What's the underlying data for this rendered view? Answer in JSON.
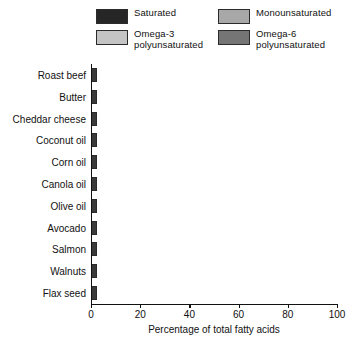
{
  "chart_data": {
    "type": "bar",
    "orientation": "horizontal",
    "stacked": true,
    "title": "",
    "xlabel": "Percentage of total fatty acids",
    "ylabel": "",
    "xlim": [
      0,
      100
    ],
    "xticks": [
      0,
      20,
      40,
      60,
      80,
      100
    ],
    "grid": false,
    "legend_position": "top",
    "categories": [
      "Roast beef",
      "Butter",
      "Cheddar cheese",
      "Coconut oil",
      "Corn oil",
      "Canola oil",
      "Olive oil",
      "Avocado",
      "Salmon",
      "Walnuts",
      "Flax seed"
    ],
    "series": [
      {
        "name": "Saturated",
        "color": "#262626",
        "values": [
          40,
          64,
          67,
          92,
          13,
          7,
          14,
          17,
          24,
          10,
          9
        ]
      },
      {
        "name": "Monounsaturated",
        "color": "#a8a8a8",
        "values": [
          55,
          30,
          28,
          5,
          24,
          61,
          77,
          69,
          43,
          13,
          21
        ]
      },
      {
        "name": "Omega-3 polyunsaturated",
        "color": "#c4c4c4",
        "values": [
          1,
          2,
          2,
          1,
          1,
          10,
          1,
          1,
          24,
          15,
          56
        ]
      },
      {
        "name": "Omega-6 polyunsaturated",
        "color": "#757575",
        "values": [
          4,
          4,
          3,
          2,
          62,
          22,
          8,
          13,
          9,
          62,
          14
        ]
      }
    ]
  },
  "legend": {
    "entries": [
      {
        "label": "Saturated",
        "color": "#262626"
      },
      {
        "label": "Monounsaturated",
        "color": "#a8a8a8"
      },
      {
        "label": "Omega-3\npolyunsaturated",
        "color": "#c4c4c4"
      },
      {
        "label": "Omega-6\npolyunsaturated",
        "color": "#757575"
      }
    ]
  },
  "axis": {
    "x_title": "Percentage of total fatty acids",
    "x_ticks": [
      "0",
      "20",
      "40",
      "60",
      "80",
      "100"
    ]
  }
}
